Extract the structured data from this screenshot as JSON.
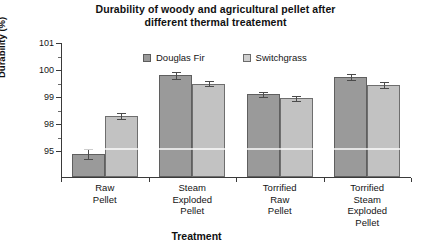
{
  "chart_data": {
    "type": "bar",
    "title": "Durability of woody and agricultural pellet after different thermal treatement",
    "title_line1": "Durability of woody and agricultural pellet after",
    "title_line2": "different thermal treatement",
    "xlabel": "Treatment",
    "ylabel": "Durability (%)",
    "grid": false,
    "legend_position": "top-inside",
    "ytick_labels": [
      "101",
      "100",
      "99",
      "98",
      "95"
    ],
    "ytick_values": [
      101,
      100,
      99,
      98,
      95
    ],
    "ylim": [
      94,
      101
    ],
    "categories": [
      "Raw Pellet",
      "Steam Exploded Pellet",
      "Torrified Raw Pellet",
      "Torrified Steam Exploded Pellet"
    ],
    "category_lines": [
      [
        "Raw",
        "Pellet"
      ],
      [
        "Steam",
        "Exploded",
        "Pellet"
      ],
      [
        "Torrified",
        "Raw",
        "Pellet"
      ],
      [
        "Torrified",
        "Steam",
        "Exploded",
        "Pellet"
      ]
    ],
    "series": [
      {
        "name": "Douglas Fir",
        "color": "#9a9a9a",
        "values": [
          94.7,
          99.8,
          99.1,
          99.75
        ],
        "errors": [
          0.55,
          0.12,
          0.1,
          0.12
        ]
      },
      {
        "name": "Switchgrass",
        "color": "#c2c2c2",
        "values": [
          98.3,
          99.5,
          98.95,
          99.45
        ],
        "errors": [
          0.12,
          0.1,
          0.1,
          0.1
        ]
      }
    ]
  },
  "legend": {
    "items": [
      {
        "label": "Douglas Fir",
        "swatch": "fir"
      },
      {
        "label": "Switchgrass",
        "swatch": "switch"
      }
    ]
  }
}
